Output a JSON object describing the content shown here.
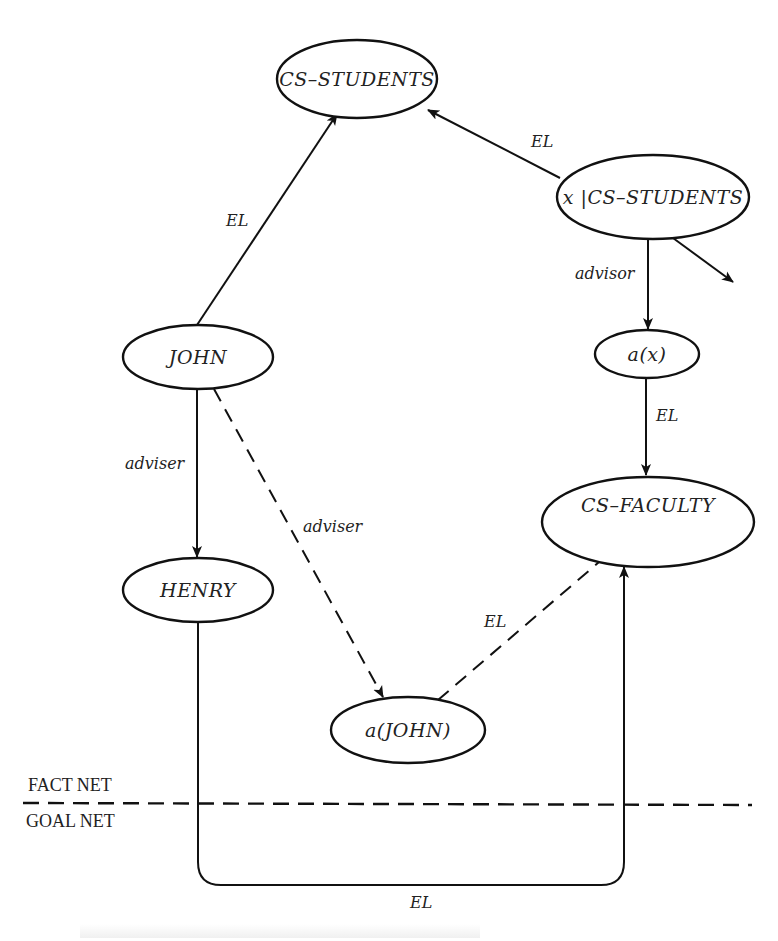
{
  "diagram": {
    "nodes": {
      "cs_students": "CS–STUDENTS",
      "x_cs_students": "x |CS–STUDENTS",
      "john": "JOHN",
      "a_x": "a(x)",
      "cs_faculty": "CS–FACULTY",
      "henry": "HENRY",
      "a_john": "a(JOHN)"
    },
    "edges": {
      "john_to_cs_students": "EL",
      "x_to_cs_students": "EL",
      "x_to_a_x": "advisor",
      "a_x_to_cs_faculty": "EL",
      "john_to_henry": "adviser",
      "john_to_a_john": "adviser",
      "a_john_to_cs_faculty": "EL",
      "henry_to_cs_faculty_goal": "EL"
    },
    "regions": {
      "upper": "FACT NET",
      "lower": "GOAL NET"
    },
    "colors": {
      "ink": "#111111",
      "background": "#ffffff"
    }
  }
}
